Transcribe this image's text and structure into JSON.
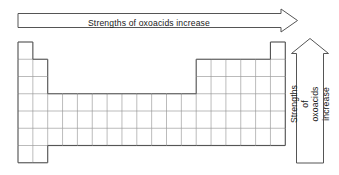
{
  "figure": {
    "type": "periodic-table-trend-diagram",
    "background_color": "#ffffff",
    "line_color": "#5a5a5a",
    "outline_color": "#4a4a4a",
    "text_color": "#1a1a1a"
  },
  "horizontal_arrow": {
    "label": "Strengths of oxoacids increase",
    "direction": "right",
    "icon": "arrow-right-icon"
  },
  "vertical_arrow": {
    "label_line_1": "Strengths of oxoacids",
    "label_line_2": "increase",
    "label": "Strengths of oxoacids increase",
    "direction": "up",
    "icon": "arrow-up-icon"
  },
  "periodic_table": {
    "columns": 18,
    "rows": 7,
    "cell_width": 14.85,
    "cell_height": 17.25,
    "origin_x": 18,
    "origin_y": 42,
    "row_spans": [
      {
        "row": 1,
        "blocks": [
          [
            1,
            1
          ],
          [
            18,
            18
          ]
        ]
      },
      {
        "row": 2,
        "blocks": [
          [
            1,
            2
          ],
          [
            13,
            18
          ]
        ]
      },
      {
        "row": 3,
        "blocks": [
          [
            1,
            2
          ],
          [
            13,
            18
          ]
        ]
      },
      {
        "row": 4,
        "blocks": [
          [
            1,
            18
          ]
        ]
      },
      {
        "row": 5,
        "blocks": [
          [
            1,
            18
          ]
        ]
      },
      {
        "row": 6,
        "blocks": [
          [
            1,
            18
          ]
        ]
      },
      {
        "row": 7,
        "blocks": [
          [
            1,
            2
          ]
        ]
      }
    ]
  }
}
